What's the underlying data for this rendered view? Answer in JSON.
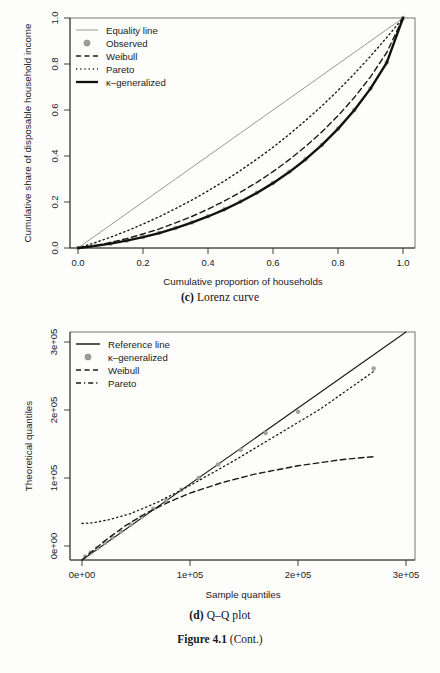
{
  "figure": {
    "label_number": "Figure 4.1",
    "label_suffix": "(Cont.)"
  },
  "panels": [
    {
      "id": "lorenz",
      "caption_tag": "(c)",
      "caption_text": "Lorenz curve",
      "xlabel": "Cumulative proportion of households",
      "ylabel": "Cumulative share of disposable household income",
      "xticks": [
        "0.0",
        "0.2",
        "0.4",
        "0.6",
        "0.8",
        "1.0"
      ],
      "yticks": [
        "0.0",
        "0.2",
        "0.4",
        "0.6",
        "0.8",
        "1.0"
      ],
      "legend": [
        {
          "label": "Equality line",
          "symbol": "thin-line",
          "color": "#7d7d7d"
        },
        {
          "label": "Observed",
          "symbol": "filled-circle",
          "color": "#9a9a9a"
        },
        {
          "label": "Weibull",
          "symbol": "dashed-line",
          "color": "#1a1a1a"
        },
        {
          "label": "Pareto",
          "symbol": "dotted-line",
          "color": "#1a1a1a"
        },
        {
          "label": "κ–generalized",
          "symbol": "thick-line",
          "color": "#111111"
        }
      ]
    },
    {
      "id": "qq",
      "caption_tag": "(d)",
      "caption_text": "Q–Q plot",
      "xlabel": "Sample quantiles",
      "ylabel": "Theoretical quantiles",
      "xticks": [
        "0e+00",
        "1e+05",
        "2e+05",
        "3e+05"
      ],
      "yticks": [
        "0e+00",
        "1e+05",
        "2e+05",
        "3e+05"
      ],
      "legend": [
        {
          "label": "Reference line",
          "symbol": "solid-line",
          "color": "#1a1a1a"
        },
        {
          "label": "κ–generalized",
          "symbol": "filled-circle",
          "color": "#9a9a9a"
        },
        {
          "label": "Weibull",
          "symbol": "dashed-line",
          "color": "#1a1a1a"
        },
        {
          "label": "Pareto",
          "symbol": "dash-dot-line",
          "color": "#1a1a1a"
        }
      ]
    }
  ],
  "chart_data": [
    {
      "type": "line",
      "id": "lorenz",
      "title": "(c) Lorenz curve",
      "xlabel": "Cumulative proportion of households",
      "ylabel": "Cumulative share of disposable household income",
      "xlim": [
        0,
        1
      ],
      "ylim": [
        0,
        1
      ],
      "grid": false,
      "legend_position": "top-left",
      "x": [
        0,
        0.05,
        0.1,
        0.15,
        0.2,
        0.25,
        0.3,
        0.35,
        0.4,
        0.45,
        0.5,
        0.55,
        0.6,
        0.65,
        0.7,
        0.75,
        0.8,
        0.85,
        0.9,
        0.95,
        1
      ],
      "series": [
        {
          "name": "Equality line",
          "style": "thin-solid",
          "values": [
            0,
            0.05,
            0.1,
            0.15,
            0.2,
            0.25,
            0.3,
            0.35,
            0.4,
            0.45,
            0.5,
            0.55,
            0.6,
            0.65,
            0.7,
            0.75,
            0.8,
            0.85,
            0.9,
            0.95,
            1
          ]
        },
        {
          "name": "Observed",
          "style": "points",
          "values": [
            0,
            0.008,
            0.019,
            0.032,
            0.048,
            0.066,
            0.087,
            0.111,
            0.138,
            0.168,
            0.202,
            0.24,
            0.283,
            0.331,
            0.386,
            0.448,
            0.519,
            0.6,
            0.694,
            0.807,
            1
          ]
        },
        {
          "name": "Weibull",
          "style": "dashed",
          "values": [
            0,
            0.01,
            0.024,
            0.041,
            0.061,
            0.083,
            0.109,
            0.137,
            0.169,
            0.204,
            0.243,
            0.285,
            0.332,
            0.384,
            0.441,
            0.504,
            0.575,
            0.654,
            0.744,
            0.85,
            1
          ]
        },
        {
          "name": "Pareto",
          "style": "dotted",
          "values": [
            0,
            0.022,
            0.047,
            0.074,
            0.104,
            0.136,
            0.171,
            0.208,
            0.248,
            0.291,
            0.337,
            0.386,
            0.438,
            0.494,
            0.554,
            0.617,
            0.685,
            0.757,
            0.834,
            0.915,
            1
          ]
        },
        {
          "name": "κ–generalized",
          "style": "thick-solid",
          "values": [
            0,
            0.008,
            0.019,
            0.032,
            0.047,
            0.065,
            0.086,
            0.11,
            0.137,
            0.167,
            0.201,
            0.239,
            0.282,
            0.33,
            0.385,
            0.447,
            0.518,
            0.599,
            0.693,
            0.806,
            1
          ]
        }
      ]
    },
    {
      "type": "line",
      "id": "qq",
      "title": "(d) Q–Q plot",
      "xlabel": "Sample quantiles",
      "ylabel": "Theoretical quantiles",
      "xlim": [
        0,
        300000
      ],
      "ylim": [
        0,
        300000
      ],
      "grid": false,
      "legend_position": "top-left",
      "series": [
        {
          "name": "Reference line",
          "style": "solid",
          "x": [
            0,
            300000
          ],
          "values": [
            0,
            300000
          ]
        },
        {
          "name": "κ–generalized",
          "style": "points",
          "x": [
            3000,
            8000,
            14000,
            21000,
            28000,
            36000,
            45000,
            55000,
            66000,
            78000,
            92000,
            108000,
            126000,
            147000,
            170000,
            200000,
            270000
          ],
          "values": [
            4500,
            9500,
            15500,
            22500,
            29500,
            37500,
            46500,
            56500,
            67500,
            79000,
            92500,
            108000,
            125500,
            145000,
            167000,
            195000,
            252000
          ]
        },
        {
          "name": "Weibull",
          "style": "dashed",
          "x": [
            0,
            20000,
            40000,
            60000,
            80000,
            100000,
            130000,
            160000,
            200000,
            240000,
            270000
          ],
          "values": [
            0,
            24000,
            45000,
            62000,
            76000,
            88000,
            102000,
            113000,
            124000,
            132000,
            136000
          ]
        },
        {
          "name": "Pareto",
          "style": "dash-dot",
          "x": [
            0,
            10000,
            25000,
            45000,
            70000,
            100000,
            140000,
            180000,
            220000,
            270000
          ],
          "values": [
            48000,
            49000,
            53000,
            61000,
            76000,
            98000,
            130000,
            164000,
            198000,
            248000
          ]
        }
      ]
    }
  ]
}
